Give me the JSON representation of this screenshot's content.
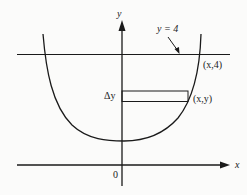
{
  "diagram": {
    "title": "",
    "axes": {
      "x_label": "x",
      "y_label": "y",
      "origin_label": "0"
    },
    "line": {
      "label": "y = 4",
      "equation": "y = 4"
    },
    "points": [
      {
        "label": "(x,4)"
      },
      {
        "label": "(x,y)"
      }
    ],
    "strip": {
      "label": "Δy"
    },
    "curve": {
      "type": "parabola",
      "description": "upward-opening U-shaped curve with vertex on the y-axis above the origin"
    }
  }
}
